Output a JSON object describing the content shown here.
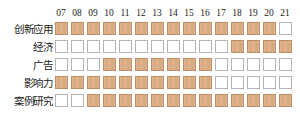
{
  "matrix": {
    "columns": [
      "07",
      "08",
      "09",
      "10",
      "11",
      "12",
      "13",
      "14",
      "15",
      "16",
      "17",
      "18",
      "19",
      "20",
      "21"
    ],
    "rows": [
      {
        "label": "创新应用",
        "cells": [
          1,
          1,
          1,
          1,
          1,
          1,
          1,
          1,
          1,
          1,
          1,
          1,
          1,
          1,
          0
        ]
      },
      {
        "label": "经济",
        "cells": [
          0,
          0,
          0,
          0,
          0,
          0,
          0,
          0,
          0,
          0,
          0,
          1,
          1,
          1,
          1
        ]
      },
      {
        "label": "广告",
        "cells": [
          0,
          0,
          0,
          1,
          1,
          1,
          1,
          1,
          1,
          1,
          0,
          0,
          0,
          0,
          0
        ]
      },
      {
        "label": "影响力",
        "cells": [
          1,
          1,
          1,
          1,
          1,
          1,
          1,
          1,
          1,
          1,
          0,
          0,
          0,
          0,
          0
        ]
      },
      {
        "label": "案例研究",
        "cells": [
          0,
          0,
          1,
          1,
          1,
          1,
          1,
          1,
          1,
          1,
          1,
          1,
          1,
          1,
          1
        ]
      }
    ],
    "colors": {
      "filled": "#d9a87c",
      "filled_border": "#bf9068",
      "empty": "#ffffff",
      "empty_border": "#b4b4b4",
      "text": "#1a1a1a"
    }
  },
  "chart_data": {
    "type": "heatmap",
    "title": "",
    "xlabel": "",
    "ylabel": "",
    "categories": [
      "07",
      "08",
      "09",
      "10",
      "11",
      "12",
      "13",
      "14",
      "15",
      "16",
      "17",
      "18",
      "19",
      "20",
      "21"
    ],
    "series": [
      {
        "name": "创新应用",
        "values": [
          1,
          1,
          1,
          1,
          1,
          1,
          1,
          1,
          1,
          1,
          1,
          1,
          1,
          1,
          0
        ]
      },
      {
        "name": "经济",
        "values": [
          0,
          0,
          0,
          0,
          0,
          0,
          0,
          0,
          0,
          0,
          0,
          1,
          1,
          1,
          1
        ]
      },
      {
        "name": "广告",
        "values": [
          0,
          0,
          0,
          1,
          1,
          1,
          1,
          1,
          1,
          1,
          0,
          0,
          0,
          0,
          0
        ]
      },
      {
        "name": "影响力",
        "values": [
          1,
          1,
          1,
          1,
          1,
          1,
          1,
          1,
          1,
          1,
          0,
          0,
          0,
          0,
          0
        ]
      },
      {
        "name": "案例研究",
        "values": [
          0,
          0,
          1,
          1,
          1,
          1,
          1,
          1,
          1,
          1,
          1,
          1,
          1,
          1,
          1
        ]
      }
    ],
    "value_map": {
      "1": "filled",
      "0": "empty"
    },
    "legend": [],
    "grid": false
  }
}
